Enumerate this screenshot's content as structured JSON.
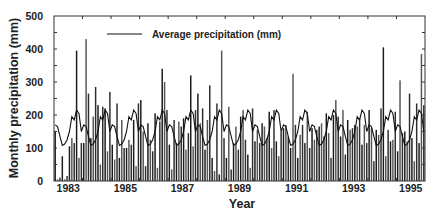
{
  "chart_data": {
    "type": "bar",
    "title": "",
    "xlabel": "Year",
    "ylabel": "Monthly precipitation (mm)",
    "ylim": [
      0,
      500
    ],
    "yticks": [
      0,
      100,
      200,
      300,
      400,
      500
    ],
    "xlim_years": [
      1983,
      1996
    ],
    "xtick_labels": [
      "1983",
      "1985",
      "1987",
      "1989",
      "1991",
      "1993",
      "1995"
    ],
    "grid": false,
    "legend": {
      "position": "top-center",
      "entries": [
        {
          "label": "Average precipitation (mm)",
          "type": "line"
        }
      ]
    },
    "series": [
      {
        "name": "Monthly precipitation (mm)",
        "type": "bar",
        "start": "1983-01",
        "frequency": "monthly",
        "values": [
          150,
          5,
          10,
          75,
          5,
          15,
          105,
          130,
          115,
          395,
          70,
          115,
          115,
          430,
          265,
          130,
          195,
          285,
          230,
          50,
          225,
          220,
          90,
          270,
          110,
          65,
          235,
          70,
          185,
          100,
          100,
          125,
          110,
          185,
          45,
          235,
          245,
          150,
          45,
          175,
          125,
          90,
          205,
          40,
          180,
          340,
          300,
          215,
          110,
          35,
          185,
          115,
          180,
          165,
          190,
          95,
          145,
          320,
          105,
          215,
          265,
          175,
          220,
          95,
          185,
          290,
          70,
          30,
          235,
          20,
          395,
          130,
          70,
          225,
          35,
          115,
          165,
          95,
          195,
          215,
          125,
          80,
          40,
          220,
          120,
          155,
          115,
          175,
          165,
          130,
          210,
          100,
          215,
          120,
          75,
          150,
          160,
          170,
          135,
          100,
          325,
          170,
          70,
          140,
          170,
          115,
          210,
          100,
          160,
          125,
          155,
          165,
          175,
          135,
          205,
          145,
          70,
          200,
          245,
          195,
          135,
          215,
          80,
          185,
          155,
          160,
          170,
          165,
          190,
          110,
          170,
          115,
          215,
          160,
          60,
          155,
          140,
          220,
          405,
          75,
          155,
          120,
          125,
          210,
          90,
          305,
          145,
          150,
          120,
          265,
          130,
          60,
          235,
          115,
          385,
          230
        ]
      },
      {
        "name": "Average precipitation (mm)",
        "type": "line",
        "start": "1983-01",
        "frequency": "monthly",
        "climatology_by_month": [
          170,
          165,
          135,
          108,
          112,
          125,
          150,
          195,
          185,
          215,
          205,
          150
        ]
      }
    ]
  }
}
